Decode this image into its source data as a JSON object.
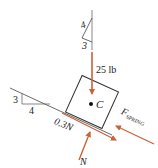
{
  "diagram": {
    "type": "free-body-diagram",
    "colors": {
      "line": "#333333",
      "force": "#c8623c",
      "text": "#222222"
    },
    "reference_triangle": {
      "hyp": "4",
      "leg": "3"
    },
    "slope_triangle": {
      "rise": "3",
      "run": "4"
    },
    "forces": {
      "weight": "25 lb",
      "friction": "0.3N",
      "normal": "N",
      "spring_main": "F",
      "spring_sub": "SPRING"
    },
    "center_label": "C"
  }
}
